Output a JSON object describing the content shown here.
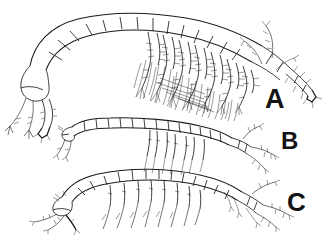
{
  "figure": {
    "title_clipped": "· ·· ····· ··",
    "background_color": "#ffffff",
    "ink_color": "#1d1d1d",
    "width": 330,
    "height": 240,
    "type": "scientific-line-drawing-plate"
  },
  "panels": [
    {
      "id": "A",
      "label": "A",
      "label_x": 265,
      "label_y": 86,
      "font_size": 27,
      "description": "Largest specimen, strongly arched segmented body with dense plumose setae on pereopods and long multi-articulate antenna",
      "body_segments": 13,
      "appendage_pairs": 8
    },
    {
      "id": "B",
      "label": "B",
      "label_x": 281,
      "label_y": 129,
      "font_size": 24,
      "description": "Smallest slender specimen, nearly straight narrow segmented body with short sparse setae",
      "body_segments": 15,
      "appendage_pairs": 6
    },
    {
      "id": "C",
      "label": "C",
      "label_x": 287,
      "label_y": 189,
      "font_size": 26,
      "description": "Medium elongate specimen, gently arched body with long straight simple setae and branched uropods",
      "body_segments": 15,
      "appendage_pairs": 8
    }
  ]
}
